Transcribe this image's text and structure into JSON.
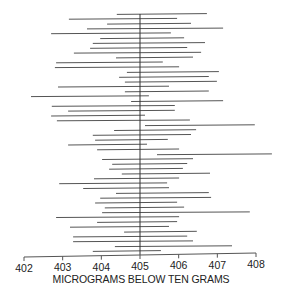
{
  "chart_data": {
    "type": "interval",
    "title": "",
    "xlabel": "MICROGRAMS BELOW TEN GRAMS",
    "ylabel": "",
    "xlim": [
      402,
      408
    ],
    "xticks": [
      402,
      403,
      404,
      405,
      406,
      407,
      408
    ],
    "xtick_labels": [
      "402",
      "403",
      "404",
      "405",
      "406",
      "407",
      "408"
    ],
    "reference_line": 405,
    "grid": false,
    "legend": "none",
    "line_color": "#555555",
    "intervals": [
      [
        404.4,
        406.73
      ],
      [
        403.16,
        405.96
      ],
      [
        404.15,
        406.32
      ],
      [
        403.63,
        407.15
      ],
      [
        402.7,
        405.8
      ],
      [
        403.97,
        406.14
      ],
      [
        403.78,
        406.68
      ],
      [
        403.71,
        406.22
      ],
      [
        403.29,
        406.58
      ],
      [
        404.38,
        406.37
      ],
      [
        402.83,
        405.59
      ],
      [
        402.8,
        406.01
      ],
      [
        404.66,
        407.04
      ],
      [
        404.46,
        406.78
      ],
      [
        404.61,
        406.99
      ],
      [
        402.88,
        405.75
      ],
      [
        404.61,
        406.78
      ],
      [
        402.18,
        405.23
      ],
      [
        404.77,
        407.15
      ],
      [
        402.72,
        405.9
      ],
      [
        403.14,
        405.9
      ],
      [
        402.7,
        405.13
      ],
      [
        402.85,
        406.29
      ],
      [
        405.13,
        407.97
      ],
      [
        404.33,
        406.45
      ],
      [
        403.78,
        406.32
      ],
      [
        403.84,
        405.72
      ],
      [
        403.14,
        405.18
      ],
      [
        403.89,
        406.01
      ],
      [
        405.44,
        408.41
      ],
      [
        404.02,
        406.37
      ],
      [
        404.28,
        406.22
      ],
      [
        404.2,
        406.11
      ],
      [
        404.53,
        406.81
      ],
      [
        403.81,
        406.01
      ],
      [
        402.91,
        405.7
      ],
      [
        403.53,
        405.75
      ],
      [
        404.38,
        406.78
      ],
      [
        403.97,
        406.84
      ],
      [
        403.84,
        405.96
      ],
      [
        404.09,
        406.14
      ],
      [
        404.02,
        407.84
      ],
      [
        402.83,
        406.01
      ],
      [
        403.89,
        405.96
      ],
      [
        403.19,
        405.75
      ],
      [
        404.59,
        406.47
      ],
      [
        403.27,
        406.22
      ],
      [
        403.27,
        406.37
      ],
      [
        404.35,
        407.38
      ],
      [
        403.78,
        405.54
      ]
    ]
  }
}
